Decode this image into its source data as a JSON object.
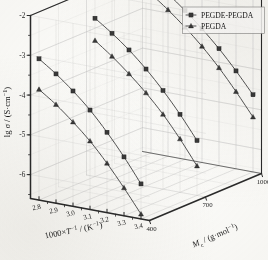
{
  "chart_data": {
    "type": "line",
    "projection": "3d-isometric",
    "title": "",
    "subtitle": "",
    "xlabel": "1000×T⁻¹ / (K⁻¹)",
    "ylabel": "lg σ / (S·cm⁻¹)",
    "zlabel": "Mᴄ / (g·mol⁻¹)",
    "xlabel_parts": {
      "lead": "1000×",
      "italic": "T",
      "sup1": "−1",
      "mid": " / (K",
      "sup2": "−1",
      "tail": ")"
    },
    "ylabel_parts": {
      "lead": "lg ",
      "italic": "σ",
      "mid": " / (S·cm",
      "sup": "−1",
      "tail": ")"
    },
    "zlabel_parts": {
      "italic": "M",
      "sub": "c",
      "mid": " / (g·mol",
      "sup": "−1",
      "tail": ")"
    },
    "xticks": [
      "2.8",
      "2.9",
      "3.0",
      "3.1",
      "3.2",
      "3.3",
      "3.4"
    ],
    "xtick_values": [
      2.8,
      2.9,
      3.0,
      3.1,
      3.2,
      3.3,
      3.4
    ],
    "xlim": [
      2.75,
      3.45
    ],
    "yticks": [
      "-2",
      "-3",
      "-4",
      "-5",
      "-6"
    ],
    "ytick_values": [
      -2,
      -3,
      -4,
      -5,
      -6
    ],
    "ylim": [
      -6.6,
      -2.0
    ],
    "zticks": [
      "400",
      "700",
      "1000"
    ],
    "ztick_values": [
      400,
      700,
      1000
    ],
    "zlim": [
      400,
      1000
    ],
    "grid": true,
    "grid_planes": [
      "back-xy",
      "left-yz",
      "floor-xz"
    ],
    "legend_position": "top-right",
    "legend": [
      {
        "label": "PEGDE-PEGDA",
        "marker": "square",
        "color": "#3f3f3f"
      },
      {
        "label": "PEGDA",
        "marker": "triangle",
        "color": "#3f3f3f"
      }
    ],
    "series": [
      {
        "name": "PEGDE-PEGDA",
        "marker": "square",
        "color": "#4a4a4a",
        "z": 400,
        "z_label": "400",
        "x": [
          2.8,
          2.9,
          3.0,
          3.1,
          3.2,
          3.3,
          3.4
        ],
        "values": [
          -3.05,
          -3.35,
          -3.7,
          -4.1,
          -4.58,
          -5.12,
          -5.72
        ]
      },
      {
        "name": "PEGDA",
        "marker": "triangle",
        "color": "#4a4a4a",
        "z": 400,
        "z_label": "400",
        "x": [
          2.8,
          2.9,
          3.0,
          3.1,
          3.2,
          3.3,
          3.4
        ],
        "values": [
          -3.82,
          -4.12,
          -4.48,
          -4.88,
          -5.36,
          -5.9,
          -6.48
        ]
      },
      {
        "name": "PEGDE-PEGDA",
        "marker": "square",
        "color": "#4a4a4a",
        "z": 700,
        "z_label": "700",
        "x": [
          2.8,
          2.9,
          3.0,
          3.1,
          3.2,
          3.3,
          3.4
        ],
        "values": [
          -2.62,
          -2.92,
          -3.26,
          -3.66,
          -4.12,
          -4.64,
          -5.22
        ]
      },
      {
        "name": "PEGDA",
        "marker": "triangle",
        "color": "#4a4a4a",
        "z": 700,
        "z_label": "700",
        "x": [
          2.8,
          2.9,
          3.0,
          3.1,
          3.2,
          3.3,
          3.4
        ],
        "values": [
          -3.18,
          -3.5,
          -3.86,
          -4.26,
          -4.72,
          -5.26,
          -5.86
        ]
      },
      {
        "name": "PEGDE-PEGDA",
        "marker": "square",
        "color": "#4a4a4a",
        "z": 1000,
        "z_label": "1000",
        "x": [
          2.8,
          2.9,
          3.0,
          3.1,
          3.2,
          3.3,
          3.4
        ],
        "values": [
          -2.22,
          -2.52,
          -2.86,
          -3.24,
          -3.66,
          -4.14,
          -4.66
        ]
      },
      {
        "name": "PEGDA",
        "marker": "triangle",
        "color": "#4a4a4a",
        "z": 1000,
        "z_label": "1000",
        "x": [
          2.8,
          2.9,
          3.0,
          3.1,
          3.2,
          3.3,
          3.4
        ],
        "values": [
          -2.6,
          -2.92,
          -3.28,
          -3.68,
          -4.14,
          -4.66,
          -5.22
        ]
      }
    ],
    "colors": {
      "axis": "#2b2b2b",
      "grid": "#c8c8c8",
      "curve": "#4a4a4a",
      "marker_fill": "#3a3a3a",
      "background": "#fdfdfb",
      "legend_border": "#808080"
    }
  }
}
